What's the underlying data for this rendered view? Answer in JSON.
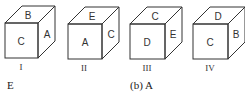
{
  "cubes": [
    {
      "label": "I",
      "top": "B",
      "front": "C",
      "right": "A"
    },
    {
      "label": "II",
      "top": "E",
      "front": "A",
      "right": "C"
    },
    {
      "label": "III",
      "top": "C",
      "front": "D",
      "right": "E"
    },
    {
      "label": "IV",
      "top": "D",
      "front": "C",
      "right": "B"
    }
  ],
  "options": [
    {
      "text": "E"
    },
    {
      "text": "(b)  A"
    }
  ],
  "colors": {
    "stroke": "#333333",
    "text": "#333333"
  }
}
